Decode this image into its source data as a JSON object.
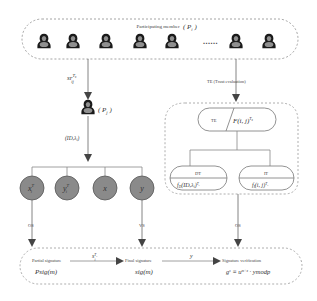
{
  "participants": {
    "title": "Participating member",
    "symbol": "P",
    "subscript": "i",
    "count_left": 5,
    "ellipsis": "......",
    "count_right": 2
  },
  "edges": {
    "share_label": "s",
    "share_label_full": "sr_ij^{T_x}",
    "share_sup": "T",
    "share_sub": "ij",
    "trust_eval_label": "TE (Trust evaluation)",
    "id_lambda_label": "(ID, λ_i)",
    "os_left": "OS",
    "vs": "VS",
    "os_right": "OS",
    "partial_to_final": "s_i^{T_x}",
    "final_to_verify": "y"
  },
  "selected_member": {
    "symbol": "P",
    "subscript": "j",
    "label": "( P_j )"
  },
  "key_nodes": [
    {
      "label": "x_i^T",
      "main": "x",
      "sup": "T",
      "sub": "i"
    },
    {
      "label": "y_i^T",
      "main": "y",
      "sup": "T",
      "sub": "i"
    },
    {
      "label": "x",
      "main": "x",
      "sup": "",
      "sub": ""
    },
    {
      "label": "y",
      "main": "y",
      "sup": "",
      "sub": ""
    }
  ],
  "trust": {
    "top_left": "TE",
    "top_right": "F(i, j)^{T_x}",
    "dt_title": "DT",
    "dt_formula": "f_D(ID, λ_i)^{T_x}",
    "it_title": "IT",
    "it_formula": "f_I(i, j)^{T_x}"
  },
  "signature": {
    "partial_title": "Partial signature",
    "partial_formula": "Psig(m)",
    "final_title": "Final signature",
    "final_formula": "sig(m)",
    "verify_title": "Signature verification",
    "verify_formula": "g^s ≡ u^{m+x} · y mod p"
  },
  "colors": {
    "stroke": "#666666",
    "dashed": "#9a9a9a",
    "node_fill": "#8a8a8a",
    "node_stroke": "#555555",
    "person_dark": "#1a1a1a",
    "person_body": "#8f8f8f"
  }
}
